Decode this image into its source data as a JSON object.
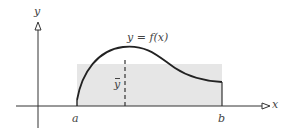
{
  "diagram": {
    "axes": {
      "x_label": "x",
      "y_label": "y"
    },
    "curve_label": "y = f(x)",
    "mean_label": "y",
    "interval": {
      "start_label": "a",
      "end_label": "b"
    },
    "colors": {
      "axis": "#333333",
      "curve": "#222222",
      "shading": "#e6e6e6",
      "text": "#444444",
      "dashed": "#333333"
    }
  }
}
